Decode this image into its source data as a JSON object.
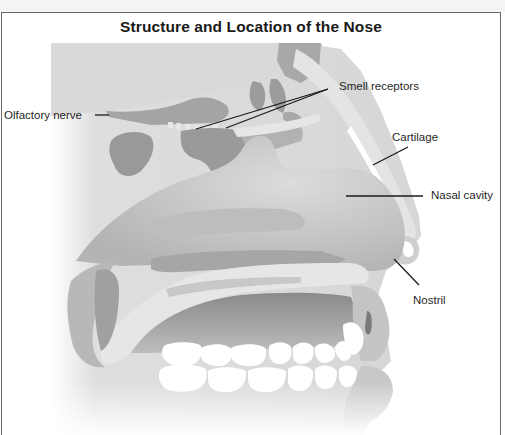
{
  "figure": {
    "title": "Structure and Location of the Nose",
    "labels": [
      {
        "id": "olfactory-nerve",
        "text": "Olfactory nerve"
      },
      {
        "id": "smell-receptors",
        "text": "Smell receptors"
      },
      {
        "id": "cartilage",
        "text": "Cartilage"
      },
      {
        "id": "nasal-cavity",
        "text": "Nasal cavity"
      },
      {
        "id": "nostril",
        "text": "Nostril"
      }
    ]
  },
  "colors": {
    "border": "#6a6a6a",
    "tissue_light": "#dcdcdc",
    "tissue_mid": "#bdbdbd",
    "tissue_dark": "#8e8e8e",
    "teeth": "#ffffff",
    "leader_line": "#1a1a1a"
  }
}
